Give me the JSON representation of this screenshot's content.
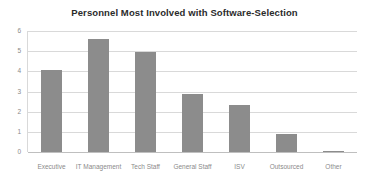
{
  "chart_data": {
    "type": "bar",
    "title": "Personnel Most Involved with Software-Selection",
    "xlabel": "",
    "ylabel": "",
    "categories": [
      "Executive",
      "IT Management",
      "Tech Staff",
      "General Staff",
      "ISV",
      "Outsourced",
      "Other"
    ],
    "values": [
      4.05,
      5.6,
      4.97,
      2.9,
      2.35,
      0.87,
      0.07
    ],
    "ylim": [
      0,
      6
    ],
    "ytick_labels": [
      "6",
      "5",
      "4",
      "3",
      "2",
      "1",
      "0"
    ],
    "ytick_values": [
      6,
      5,
      4,
      3,
      2,
      1,
      0
    ],
    "grid": true,
    "legend": false,
    "legend_position": "none",
    "bar_color": "#8c8c8c",
    "gridline_color": "#d9d9d9",
    "title_color": "#2b2b2b",
    "tick_label_color": "#8a8a8a",
    "background_color": "#ffffff"
  }
}
